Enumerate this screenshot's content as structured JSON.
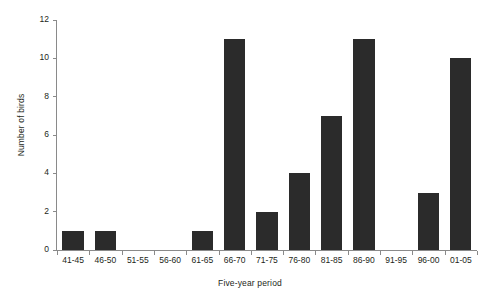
{
  "chart_data": {
    "type": "bar",
    "title": "",
    "xlabel": "Five-year period",
    "ylabel": "Number of birds",
    "categories": [
      "41-45",
      "46-50",
      "51-55",
      "56-60",
      "61-65",
      "66-70",
      "71-75",
      "76-80",
      "81-85",
      "86-90",
      "91-95",
      "96-00",
      "01-05"
    ],
    "values": [
      1,
      1,
      0,
      0,
      1,
      11,
      2,
      4,
      7,
      11,
      0,
      3,
      10
    ],
    "ylim": [
      0,
      12
    ],
    "yticks": [
      0,
      2,
      4,
      6,
      8,
      10,
      12
    ],
    "ytick_labels": [
      "0",
      "2",
      "4",
      "6",
      "8",
      "10",
      "12"
    ],
    "grid": false,
    "legend": null,
    "bar_color": "#2b2b2b",
    "axis_color": "#8a8a8a",
    "background_color": "#ffffff"
  }
}
